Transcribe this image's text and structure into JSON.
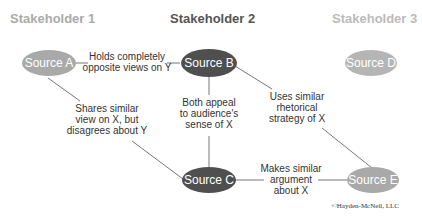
{
  "stakeholders": [
    {
      "label": "Stakeholder 1",
      "color": "#aaaaaa"
    },
    {
      "label": "Stakeholder 2",
      "color": "#555555"
    },
    {
      "label": "Stakeholder 3",
      "color": "#bbbbbb"
    }
  ],
  "nodes": {
    "a": {
      "label": "Source A",
      "color": "#a9a9a9"
    },
    "b": {
      "label": "Source B",
      "color": "#4f4f4f"
    },
    "c": {
      "label": "Source C",
      "color": "#4f4f4f"
    },
    "d": {
      "label": "Source D",
      "color": "#b5b5b5"
    },
    "e": {
      "label": "Source E",
      "color": "#a9a9a9"
    }
  },
  "edges": {
    "ab": [
      "Holds completely",
      "opposite views on Y"
    ],
    "ac": [
      "Shares similar",
      "view on X, but",
      "disagrees about Y"
    ],
    "bc": [
      "Both appeal",
      "to audience's",
      "sense of X"
    ],
    "be": [
      "Uses similar",
      "rhetorical",
      "strategy of X"
    ],
    "ce": [
      "Makes similar",
      "argument",
      "about X"
    ]
  },
  "copyright": "©Hayden-McNeil, LLC"
}
